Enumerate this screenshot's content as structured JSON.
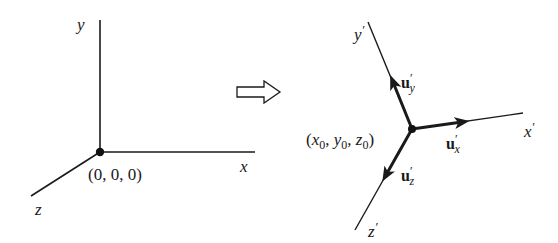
{
  "left_frame": {
    "axis_labels": {
      "x": "x",
      "y": "y",
      "z": "z"
    },
    "origin_label": "(0, 0, 0)"
  },
  "transform_arrow": {
    "icon": "hollow-right-arrow"
  },
  "right_frame": {
    "axis_labels": {
      "x": "x",
      "y": "y",
      "z": "z",
      "prime": "′"
    },
    "origin_label": {
      "open": "(",
      "x": "x",
      "y": "y",
      "z": "z",
      "sub": "0",
      "sep": ", ",
      "close": ")"
    },
    "unit_vectors": {
      "base": "u",
      "prime": "′",
      "x_sub": "x",
      "y_sub": "y",
      "z_sub": "z"
    }
  },
  "colors": {
    "stroke": "#1a1a1a",
    "background": "#ffffff"
  }
}
